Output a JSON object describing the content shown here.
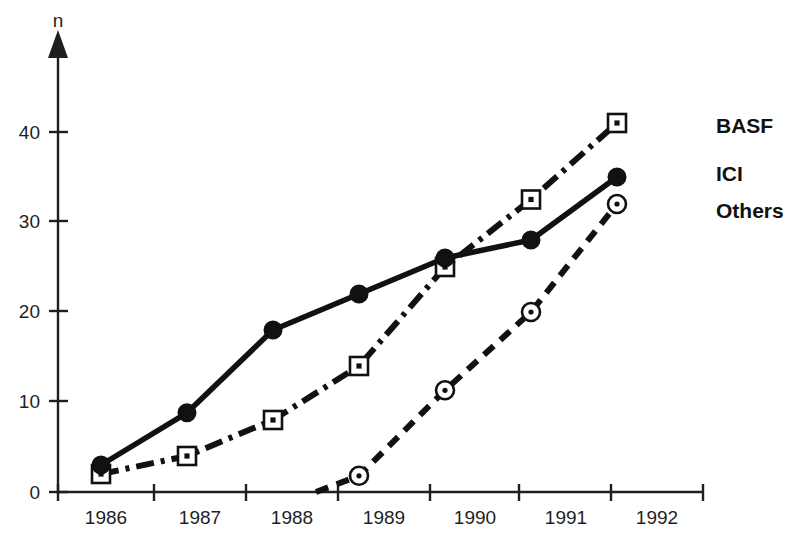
{
  "chart_data": {
    "type": "line",
    "title": "",
    "subtitle": "",
    "xlabel": "",
    "ylabel": "n",
    "y_axis_name": "n",
    "xlim": [
      1985.5,
      1993.0
    ],
    "ylim": [
      0,
      45
    ],
    "yticks": [
      0,
      10,
      20,
      30,
      40
    ],
    "ytick_labels": [
      "0",
      "10",
      "20",
      "30",
      "40"
    ],
    "x_tick_years": [
      1985.5,
      1986.5,
      1987.5,
      1988.5,
      1989.5,
      1990.5,
      1991.5,
      1992.5
    ],
    "categories": [
      "1986",
      "1987",
      "1988",
      "1989",
      "1990",
      "1991",
      "1992"
    ],
    "xtick_labels": [
      "1986",
      "1987",
      "1988",
      "1989",
      "1990",
      "1991",
      "1992"
    ],
    "grid": false,
    "legend_position": "right-inline",
    "series": [
      {
        "name": "BASF",
        "marker": "square-dot",
        "line_style": "dash-dot",
        "color": "#111111",
        "x": [
          1986,
          1987,
          1988,
          1989,
          1990,
          1991,
          1992
        ],
        "values": [
          2,
          4,
          8,
          14,
          25,
          32.5,
          41
        ]
      },
      {
        "name": "ICI",
        "marker": "filled-circle",
        "line_style": "solid",
        "color": "#111111",
        "x": [
          1986,
          1987,
          1988,
          1989,
          1990,
          1991,
          1992
        ],
        "values": [
          3,
          8.8,
          18,
          22,
          26,
          28,
          35
        ]
      },
      {
        "name": "Others",
        "marker": "open-circle",
        "line_style": "dashed",
        "color": "#111111",
        "x": [
          1988.5,
          1989,
          1990,
          1991,
          1992
        ],
        "values": [
          0,
          1.8,
          11.3,
          20,
          32
        ]
      }
    ]
  },
  "legend": {
    "entries": [
      {
        "label": "BASF"
      },
      {
        "label": "ICI"
      },
      {
        "label": "Others"
      }
    ]
  },
  "axis": {
    "y_name": "n",
    "y_labels": [
      "40",
      "30",
      "20",
      "10",
      "0"
    ],
    "x_labels": [
      "1986",
      "1987",
      "1988",
      "1989",
      "1990",
      "1991",
      "1992"
    ]
  }
}
